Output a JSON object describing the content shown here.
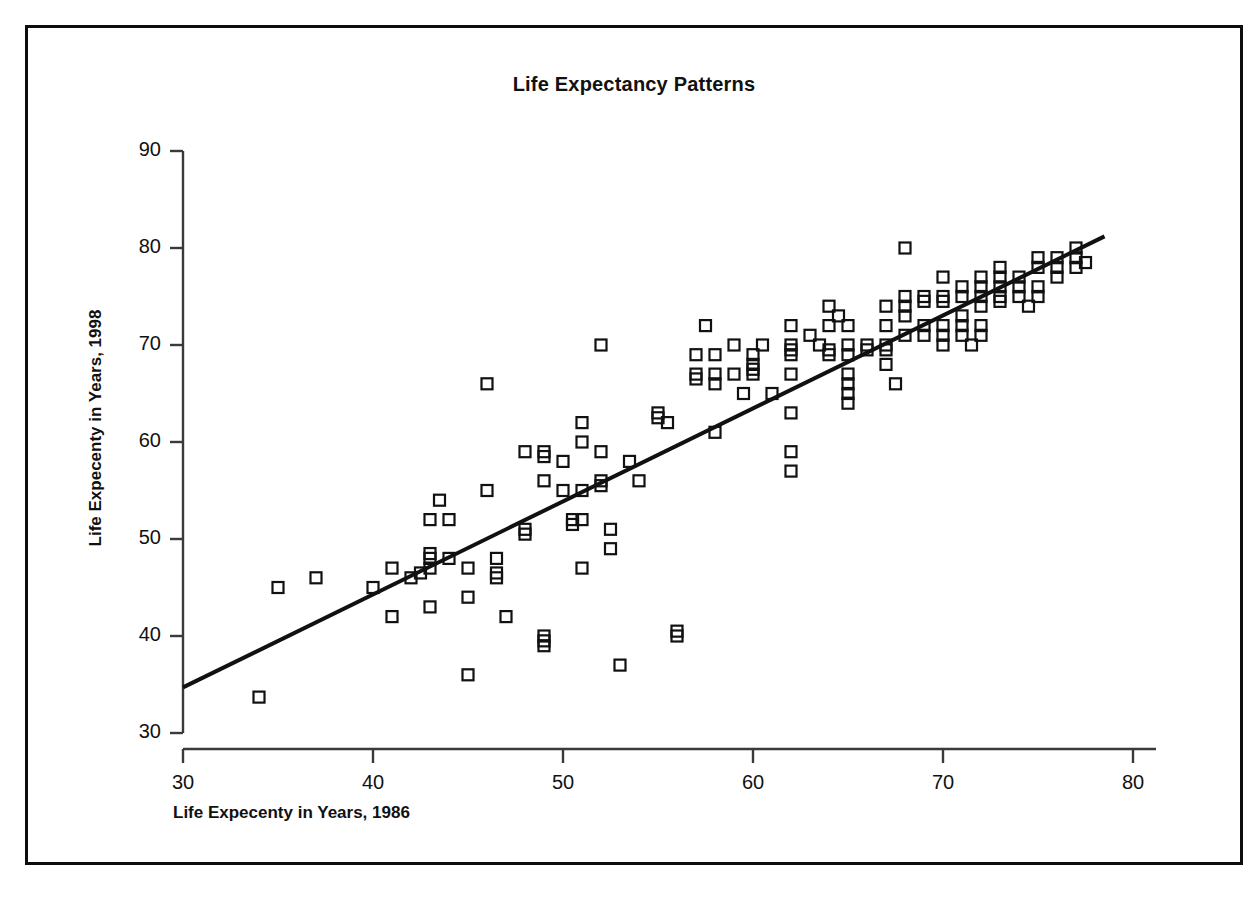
{
  "chart_data": {
    "type": "scatter",
    "title": "Life Expectancy Patterns",
    "xlabel": "Life Expecenty in Years, 1986",
    "ylabel": "Life Expecenty in Years, 1998",
    "xlim": [
      30,
      80
    ],
    "ylim": [
      30,
      90
    ],
    "xticks": [
      30,
      40,
      50,
      60,
      70,
      80
    ],
    "yticks": [
      30,
      40,
      50,
      60,
      70,
      80,
      90
    ],
    "grid": false,
    "legend": null,
    "marker": "open-square",
    "marker_color": "#111111",
    "series": [
      {
        "name": "Countries",
        "points": [
          [
            34,
            33.7
          ],
          [
            35,
            45
          ],
          [
            37,
            46
          ],
          [
            40,
            45
          ],
          [
            41,
            42
          ],
          [
            41,
            47
          ],
          [
            42,
            46
          ],
          [
            42.5,
            46.5
          ],
          [
            43,
            52
          ],
          [
            43,
            48.5
          ],
          [
            43,
            48
          ],
          [
            43,
            47
          ],
          [
            43,
            43
          ],
          [
            43.5,
            54
          ],
          [
            44,
            52
          ],
          [
            44,
            48
          ],
          [
            45,
            47
          ],
          [
            45,
            44
          ],
          [
            45,
            36
          ],
          [
            46,
            66
          ],
          [
            46,
            55
          ],
          [
            46.5,
            48
          ],
          [
            46.5,
            46.5
          ],
          [
            46.5,
            46
          ],
          [
            47,
            42
          ],
          [
            48,
            59
          ],
          [
            48,
            51
          ],
          [
            48,
            50.5
          ],
          [
            49,
            56
          ],
          [
            49,
            59
          ],
          [
            49,
            58.5
          ],
          [
            49,
            40
          ],
          [
            49,
            39.5
          ],
          [
            49,
            39
          ],
          [
            50,
            58
          ],
          [
            50,
            55
          ],
          [
            50.5,
            52
          ],
          [
            50.5,
            51.5
          ],
          [
            51,
            60
          ],
          [
            51,
            62
          ],
          [
            51,
            55
          ],
          [
            51,
            52
          ],
          [
            51,
            47
          ],
          [
            52,
            70
          ],
          [
            52,
            59
          ],
          [
            52,
            56
          ],
          [
            52,
            55.5
          ],
          [
            52.5,
            51
          ],
          [
            52.5,
            49
          ],
          [
            53,
            37
          ],
          [
            53.5,
            58
          ],
          [
            54,
            56
          ],
          [
            55,
            62.5
          ],
          [
            55,
            63
          ],
          [
            55.5,
            62
          ],
          [
            56,
            40.5
          ],
          [
            56,
            40
          ],
          [
            57,
            69
          ],
          [
            57,
            67
          ],
          [
            57,
            66.5
          ],
          [
            57.5,
            72
          ],
          [
            58,
            69
          ],
          [
            58,
            67
          ],
          [
            58,
            66
          ],
          [
            58,
            61
          ],
          [
            59,
            70
          ],
          [
            59,
            67
          ],
          [
            59.5,
            65
          ],
          [
            60,
            69
          ],
          [
            60,
            68
          ],
          [
            60,
            67
          ],
          [
            60,
            67.5
          ],
          [
            60.5,
            70
          ],
          [
            61,
            65
          ],
          [
            62,
            72
          ],
          [
            62,
            70
          ],
          [
            62,
            69
          ],
          [
            62,
            69.5
          ],
          [
            62,
            67
          ],
          [
            62,
            63
          ],
          [
            62,
            59
          ],
          [
            62,
            57
          ],
          [
            63,
            71
          ],
          [
            63.5,
            70
          ],
          [
            64,
            74
          ],
          [
            64,
            72
          ],
          [
            64,
            69.5
          ],
          [
            64,
            69
          ],
          [
            64.5,
            73
          ],
          [
            65,
            72
          ],
          [
            65,
            70
          ],
          [
            65,
            69
          ],
          [
            65,
            67
          ],
          [
            65,
            66
          ],
          [
            65,
            65
          ],
          [
            65,
            64
          ],
          [
            66,
            70
          ],
          [
            66,
            69.5
          ],
          [
            67,
            74
          ],
          [
            67,
            72
          ],
          [
            67,
            70
          ],
          [
            67,
            69.5
          ],
          [
            67,
            68
          ],
          [
            67.5,
            66
          ],
          [
            68,
            80
          ],
          [
            68,
            75
          ],
          [
            68,
            74
          ],
          [
            68,
            73
          ],
          [
            68,
            71
          ],
          [
            69,
            75
          ],
          [
            69,
            74.5
          ],
          [
            69,
            72
          ],
          [
            69,
            71
          ],
          [
            70,
            77
          ],
          [
            70,
            75
          ],
          [
            70,
            74.5
          ],
          [
            70,
            72
          ],
          [
            70,
            71
          ],
          [
            70,
            70
          ],
          [
            71,
            76
          ],
          [
            71,
            75
          ],
          [
            71,
            73
          ],
          [
            71,
            72
          ],
          [
            71,
            71
          ],
          [
            71.5,
            70
          ],
          [
            72,
            77
          ],
          [
            72,
            76
          ],
          [
            72,
            75
          ],
          [
            72,
            74
          ],
          [
            72,
            72
          ],
          [
            72,
            71
          ],
          [
            73,
            78
          ],
          [
            73,
            77
          ],
          [
            73,
            76
          ],
          [
            73,
            75
          ],
          [
            73,
            74.5
          ],
          [
            74,
            77
          ],
          [
            74,
            76
          ],
          [
            74,
            75
          ],
          [
            74.5,
            74
          ],
          [
            75,
            79
          ],
          [
            75,
            78
          ],
          [
            75,
            76
          ],
          [
            75,
            75
          ],
          [
            76,
            79
          ],
          [
            76,
            78
          ],
          [
            76,
            77
          ],
          [
            77,
            80
          ],
          [
            77,
            79
          ],
          [
            77,
            78
          ],
          [
            77.5,
            78.5
          ]
        ]
      }
    ],
    "trendline": {
      "x": [
        30,
        78.5
      ],
      "y": [
        34.7,
        81.2
      ],
      "color": "#111111",
      "width": 4
    }
  }
}
